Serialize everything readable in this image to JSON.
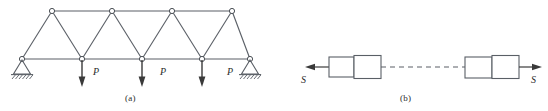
{
  "figure": {
    "panels": [
      {
        "id": "a",
        "caption": "(a)",
        "kind": "warren-truss-free-body-diagram",
        "loads": [
          {
            "label": "P",
            "at_joint": "bottom-1"
          },
          {
            "label": "P",
            "at_joint": "bottom-2"
          },
          {
            "label": "P",
            "at_joint": "bottom-3"
          }
        ],
        "supports": [
          {
            "type": "pin",
            "side": "left"
          },
          {
            "type": "pin",
            "side": "right"
          }
        ],
        "joint_count_top": 4,
        "joint_count_bottom": 5
      },
      {
        "id": "b",
        "caption": "(b)",
        "kind": "tension-member-blocks-diagram",
        "force_labels": [
          {
            "label": "S",
            "side": "left",
            "direction": "left"
          },
          {
            "label": "S",
            "side": "right",
            "direction": "right"
          }
        ],
        "block_groups": 2,
        "blocks_per_group": 2,
        "connector": "dashed-line"
      }
    ]
  },
  "colors": {
    "line": "#5a5f66",
    "ink": "#2b2b2b",
    "joint_fill": "#ffffff",
    "background": "#ffffff",
    "arrow": "#3a3a3a"
  }
}
